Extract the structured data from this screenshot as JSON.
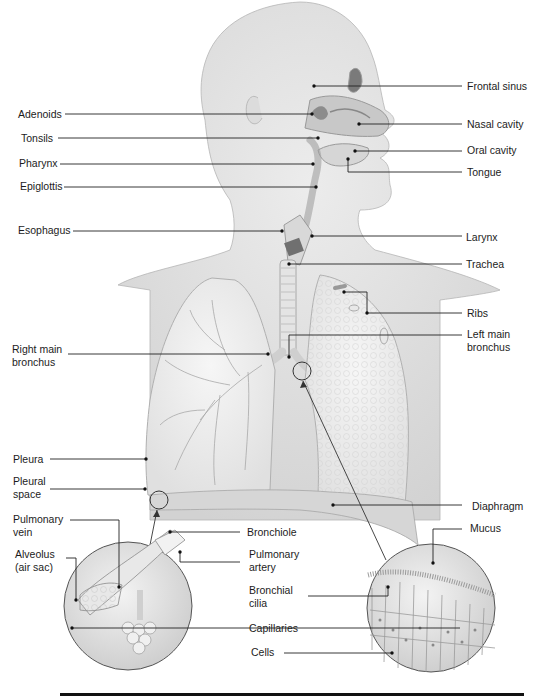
{
  "diagram": {
    "labels_left": [
      {
        "id": "adenoids",
        "text": "Adenoids",
        "x": 18,
        "y": 109
      },
      {
        "id": "tonsils",
        "text": "Tonsils",
        "x": 21,
        "y": 132
      },
      {
        "id": "pharynx",
        "text": "Pharynx",
        "x": 19,
        "y": 157
      },
      {
        "id": "epiglottis",
        "text": "Epiglottis",
        "x": 20,
        "y": 180
      },
      {
        "id": "esophagus",
        "text": "Esophagus",
        "x": 18,
        "y": 224
      },
      {
        "id": "right-main-bronchus",
        "text": "Right main\nbronchus",
        "x": 12,
        "y": 343
      },
      {
        "id": "pleura",
        "text": "Pleura",
        "x": 13,
        "y": 455
      },
      {
        "id": "pleural-space",
        "text": "Pleural\nspace",
        "x": 13,
        "y": 475
      },
      {
        "id": "pulmonary-vein",
        "text": "Pulmonary\nvein",
        "x": 13,
        "y": 513
      },
      {
        "id": "alveolus",
        "text": "Alveolus\n(air sac)",
        "x": 15,
        "y": 548
      }
    ],
    "labels_right": [
      {
        "id": "frontal-sinus",
        "text": "Frontal sinus",
        "x": 467,
        "y": 80
      },
      {
        "id": "nasal-cavity",
        "text": "Nasal cavity",
        "x": 467,
        "y": 119
      },
      {
        "id": "oral-cavity",
        "text": "Oral cavity",
        "x": 467,
        "y": 144
      },
      {
        "id": "tongue",
        "text": "Tongue",
        "x": 467,
        "y": 166
      },
      {
        "id": "larynx",
        "text": "Larynx",
        "x": 466,
        "y": 232
      },
      {
        "id": "trachea",
        "text": "Trachea",
        "x": 466,
        "y": 258
      },
      {
        "id": "ribs",
        "text": "Ribs",
        "x": 467,
        "y": 308
      },
      {
        "id": "left-main-bronchus",
        "text": "Left main\nbronchus",
        "x": 467,
        "y": 328
      },
      {
        "id": "diaphragm",
        "text": "Diaphragm",
        "x": 472,
        "y": 502
      },
      {
        "id": "mucus",
        "text": "Mucus",
        "x": 470,
        "y": 523
      }
    ],
    "labels_center": [
      {
        "id": "bronchiole",
        "text": "Bronchiole",
        "x": 247,
        "y": 526
      },
      {
        "id": "pulmonary-artery",
        "text": "Pulmonary\nartery",
        "x": 249,
        "y": 549
      },
      {
        "id": "bronchial-cilia",
        "text": "Bronchial\ncilia",
        "x": 249,
        "y": 584
      },
      {
        "id": "capillaries",
        "text": "Capillaries",
        "x": 249,
        "y": 624
      },
      {
        "id": "cells",
        "text": "Cells",
        "x": 251,
        "y": 646
      }
    ],
    "colors": {
      "skin": "#e4e4e4",
      "outline": "#9a9a9a",
      "lung": "#efefef",
      "leader": "#222222",
      "text": "#1c1c1c"
    }
  }
}
